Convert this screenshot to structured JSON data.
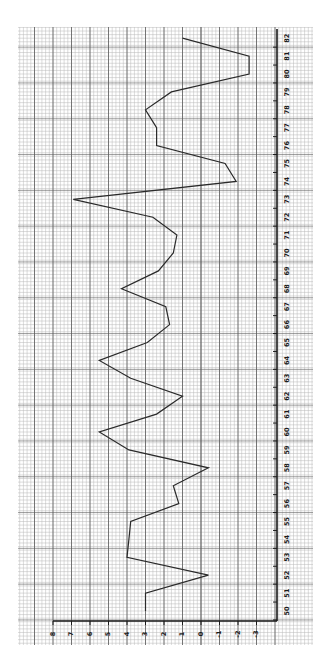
{
  "chart_data": {
    "type": "line",
    "orientation": "rotated-90-clockwise",
    "title": "",
    "xlabel": "",
    "ylabel": "",
    "x": [
      50,
      51,
      52,
      53,
      54,
      55,
      56,
      57,
      58,
      59,
      60,
      61,
      62,
      63,
      64,
      65,
      66,
      67,
      68,
      69,
      70,
      71,
      72,
      73,
      74,
      75,
      76,
      77,
      78,
      79,
      80,
      81,
      82
    ],
    "series": [
      {
        "name": "series",
        "values": [
          3.0,
          3.0,
          -0.4,
          4.0,
          3.9,
          3.8,
          1.2,
          1.5,
          -0.4,
          3.9,
          5.5,
          2.4,
          1.0,
          3.8,
          5.5,
          2.9,
          1.7,
          1.9,
          4.3,
          2.3,
          1.5,
          1.3,
          2.6,
          6.9,
          -1.9,
          -1.3,
          2.4,
          2.4,
          3.0,
          1.6,
          -2.6,
          -2.6,
          1.0
        ]
      }
    ],
    "x_tick_labels": [
      "50",
      "51",
      "52",
      "53",
      "54",
      "55",
      "56",
      "57",
      "58",
      "59",
      "60",
      "61",
      "62",
      "63",
      "64",
      "65",
      "66",
      "67",
      "68",
      "69",
      "70",
      "71",
      "72",
      "73",
      "74",
      "75",
      "76",
      "77",
      "78",
      "79",
      "80",
      "81",
      "82"
    ],
    "y_tick_labels": [
      "8",
      "7",
      "6",
      "5",
      "4",
      "3",
      "2",
      "1",
      "0",
      "-1",
      "-2",
      "-3"
    ],
    "y_ticks": [
      8,
      7,
      6,
      5,
      4,
      3,
      2,
      1,
      0,
      -1,
      -2,
      -3
    ],
    "xlim": [
      50,
      82
    ],
    "ylim": [
      -3,
      8
    ],
    "grid": true,
    "grid_style": "graph-paper",
    "legend": "none"
  },
  "colors": {
    "line": "#2a2a2a",
    "grid_minor": "#b8b8b8",
    "grid_major": "#5a5a5a",
    "axis": "#1a1a1a",
    "paper": "#ffffff"
  }
}
